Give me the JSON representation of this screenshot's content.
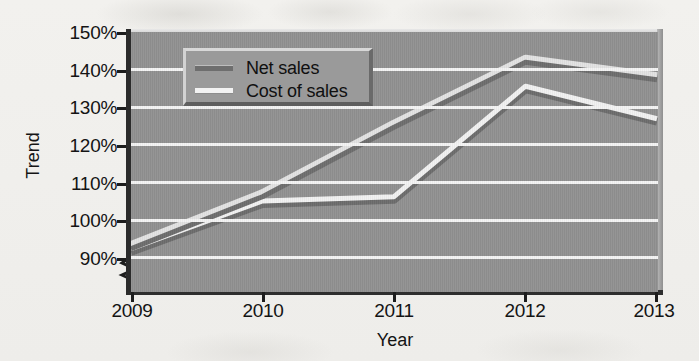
{
  "chart_data": {
    "type": "line",
    "title": "",
    "xlabel": "Year",
    "ylabel": "Trend",
    "categories": [
      "2009",
      "2010",
      "2011",
      "2012",
      "2013"
    ],
    "x": [
      2009,
      2010,
      2011,
      2012,
      2013
    ],
    "ylim": [
      90,
      150
    ],
    "y_tick_labels": [
      "90%",
      "100%",
      "110%",
      "120%",
      "130%",
      "140%",
      "150%"
    ],
    "y_tick_values": [
      90,
      100,
      110,
      120,
      130,
      140,
      150
    ],
    "y_axis_break": true,
    "grid": true,
    "legend_position": "upper-left-inside",
    "series": [
      {
        "name": "Net sales",
        "color": "#6e6e6e",
        "values": [
          100,
          112,
          128,
          143,
          139
        ]
      },
      {
        "name": "Cost of sales",
        "color": "#f2f2f2",
        "values": [
          100,
          111,
          112,
          137.5,
          130
        ]
      }
    ]
  },
  "axes": {
    "y_title": "Trend",
    "x_title": "Year",
    "y_ticks": [
      "150%",
      "140%",
      "130%",
      "120%",
      "110%",
      "100%",
      "90%"
    ],
    "x_ticks": [
      "2009",
      "2010",
      "2011",
      "2012",
      "2013"
    ]
  },
  "legend": {
    "items": [
      {
        "label": "Net sales",
        "color": "#6e6e6e"
      },
      {
        "label": "Cost of sales",
        "color": "#f2f2f2"
      }
    ]
  },
  "colors": {
    "page_background": "#f1f0ed",
    "plot_background": "#919191",
    "gridline": "#f4f4f4",
    "axis": "#1d1d1d",
    "net_sales": "#6e6e6e",
    "cost_of_sales": "#f2f2f2",
    "legend_background": "#9a9a9a"
  }
}
